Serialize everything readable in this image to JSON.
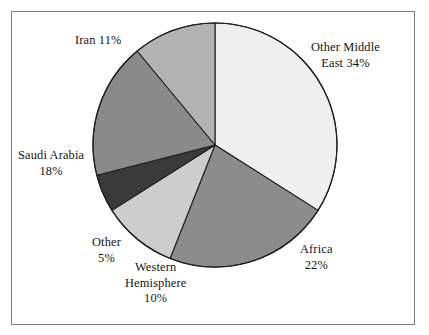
{
  "figure": {
    "background_color": "#ffffff",
    "frame_color": "#7d7d7d",
    "outline_color": "#1f1f1f"
  },
  "chart_data": {
    "type": "pie",
    "title": "",
    "subtitle": "",
    "xlabel": "",
    "ylabel": "",
    "grid": false,
    "legend_position": "none",
    "label_format": "name + percent",
    "start_angle_deg": 0,
    "direction": "clockwise",
    "total_percent": 100,
    "categories": [
      "Other Middle East",
      "Africa",
      "Western Hemisphere",
      "Other",
      "Saudi Arabia",
      "Iran"
    ],
    "values": [
      34,
      22,
      10,
      5,
      18,
      11
    ],
    "slices": [
      {
        "name": "Other Middle East",
        "value": 34,
        "percent_text": "34%",
        "color": "#efefef",
        "label_lines": [
          "Other Middle",
          "East 34%"
        ]
      },
      {
        "name": "Africa",
        "value": 22,
        "percent_text": "22%",
        "color": "#8c8c8c",
        "label_lines": [
          "Africa",
          "22%"
        ]
      },
      {
        "name": "Western Hemisphere",
        "value": 10,
        "percent_text": "10%",
        "color": "#cdcdcd",
        "label_lines": [
          "Western",
          "Hemisphere",
          "10%"
        ]
      },
      {
        "name": "Other",
        "value": 5,
        "percent_text": "5%",
        "color": "#3a3a3a",
        "label_lines": [
          "Other",
          "5%"
        ]
      },
      {
        "name": "Saudi Arabia",
        "value": 18,
        "percent_text": "18%",
        "color": "#8a8a8a",
        "label_lines": [
          "Saudi Arabia",
          "18%"
        ]
      },
      {
        "name": "Iran",
        "value": 11,
        "percent_text": "11%",
        "color": "#b3b3b3",
        "label_lines": [
          "Iran 11%"
        ]
      }
    ]
  },
  "labels": {
    "other_middle_east": {
      "line1": "Other Middle",
      "line2": "East 34%"
    },
    "africa": {
      "line1": "Africa",
      "line2": "22%"
    },
    "western_hemisphere": {
      "line1": "Western",
      "line2": "Hemisphere",
      "line3": "10%"
    },
    "other": {
      "line1": "Other",
      "line2": "5%"
    },
    "saudi_arabia": {
      "line1": "Saudi Arabia",
      "line2": "18%"
    },
    "iran": {
      "line1": "Iran 11%"
    }
  }
}
